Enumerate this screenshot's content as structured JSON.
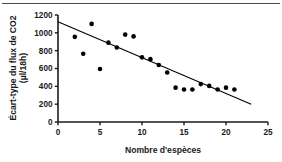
{
  "figure": {
    "name": "scatter-plot-co2-flux-vs-species",
    "background_color": "#ffffff",
    "has_top_rule": true
  },
  "chart_data": {
    "type": "scatter",
    "title": "",
    "subtitle": "",
    "xlabel": "Nombre d'espèces",
    "ylabel": "Écart-type du flux de CO2 (µl/18h)",
    "ylabel_line1": "Écart-type du flux de CO2",
    "ylabel_line2": "(µl/18h)",
    "xlim": [
      0,
      25
    ],
    "ylim": [
      0,
      1200
    ],
    "xticks": [
      0,
      5,
      10,
      15,
      20,
      25
    ],
    "yticks": [
      0,
      200,
      400,
      600,
      800,
      1000,
      1200
    ],
    "xtick_labels": [
      "0",
      "5",
      "10",
      "15",
      "20",
      "25"
    ],
    "ytick_labels": [
      "0",
      "200",
      "400",
      "600",
      "800",
      "1000",
      "1200"
    ],
    "grid": false,
    "legend": false,
    "legend_position": "none",
    "marker_style": "filled-circle",
    "marker_color": "#000000",
    "line_color": "#000000",
    "axis_color": "#1a1a1a",
    "x": [
      2,
      3,
      4,
      5,
      6,
      7,
      8,
      9,
      10,
      11,
      12,
      13,
      14,
      15,
      16,
      17,
      18,
      19,
      20,
      21
    ],
    "y": [
      955,
      765,
      1100,
      595,
      890,
      835,
      980,
      960,
      725,
      705,
      640,
      555,
      385,
      365,
      365,
      425,
      405,
      365,
      385,
      365
    ],
    "points": [
      {
        "x": 2,
        "y": 955
      },
      {
        "x": 3,
        "y": 765
      },
      {
        "x": 4,
        "y": 1100
      },
      {
        "x": 5,
        "y": 595
      },
      {
        "x": 6,
        "y": 890
      },
      {
        "x": 7,
        "y": 835
      },
      {
        "x": 8,
        "y": 980
      },
      {
        "x": 9,
        "y": 960
      },
      {
        "x": 10,
        "y": 725
      },
      {
        "x": 11,
        "y": 705
      },
      {
        "x": 12,
        "y": 640
      },
      {
        "x": 13,
        "y": 555
      },
      {
        "x": 14,
        "y": 385
      },
      {
        "x": 15,
        "y": 365
      },
      {
        "x": 16,
        "y": 365
      },
      {
        "x": 17,
        "y": 425
      },
      {
        "x": 18,
        "y": 405
      },
      {
        "x": 19,
        "y": 365
      },
      {
        "x": 20,
        "y": 385
      },
      {
        "x": 21,
        "y": 365
      }
    ],
    "trendline": {
      "type": "linear",
      "x_start": 0,
      "y_start": 1125,
      "x_end": 23,
      "y_end": 200
    }
  }
}
